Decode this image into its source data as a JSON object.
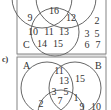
{
  "diagram_top": {
    "set_labels": {
      "C": "C"
    },
    "regions": [
      {
        "value": "16",
        "x": 54,
        "y": 14
      },
      {
        "value": "9",
        "x": 30,
        "y": 21
      },
      {
        "value": "12",
        "x": 71,
        "y": 21
      },
      {
        "value": "10",
        "x": 33,
        "y": 35
      },
      {
        "value": "11",
        "x": 49,
        "y": 35
      },
      {
        "value": "13",
        "x": 64,
        "y": 35
      },
      {
        "value": "14",
        "x": 42,
        "y": 47
      },
      {
        "value": "15",
        "x": 58,
        "y": 47
      }
    ],
    "outside": [
      {
        "value": "2",
        "x": 97,
        "y": 24
      },
      {
        "value": "3",
        "x": 87,
        "y": 37
      },
      {
        "value": "5",
        "x": 97,
        "y": 37
      },
      {
        "value": "6",
        "x": 87,
        "y": 48
      },
      {
        "value": "7",
        "x": 98,
        "y": 48
      }
    ]
  },
  "diagram_c": {
    "part_label": "c)",
    "set_labels": {
      "A": "A",
      "B": "B"
    },
    "regions": [
      {
        "value": "11",
        "x": 59,
        "y": 74
      },
      {
        "value": "13",
        "x": 64,
        "y": 84
      },
      {
        "value": "15",
        "x": 80,
        "y": 82
      },
      {
        "value": "3",
        "x": 54,
        "y": 95
      },
      {
        "value": "5",
        "x": 66,
        "y": 95
      },
      {
        "value": "7",
        "x": 60,
        "y": 104
      },
      {
        "value": "1",
        "x": 76,
        "y": 101
      },
      {
        "value": "2",
        "x": 41,
        "y": 107
      },
      {
        "value": "9",
        "x": 82,
        "y": 110
      },
      {
        "value": "10",
        "x": 96,
        "y": 110
      }
    ]
  }
}
